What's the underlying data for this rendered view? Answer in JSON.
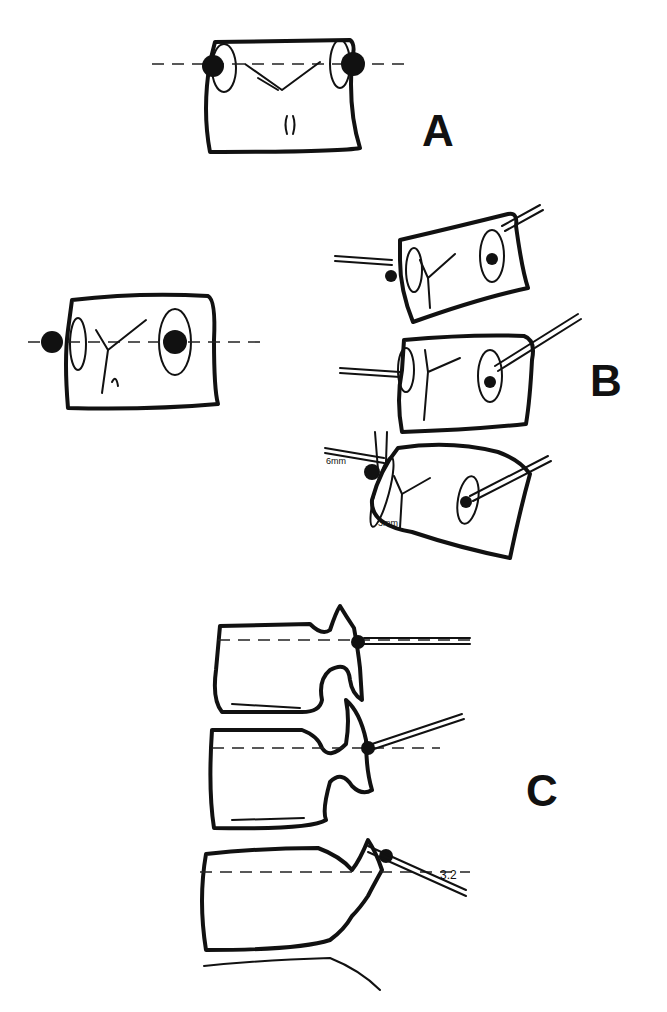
{
  "figure": {
    "panels": [
      {
        "id": "A",
        "label": "A",
        "description": "Single vertebral body, axial view with two pedicle screws on horizontal dashed reference line"
      },
      {
        "id": "B",
        "label": "B",
        "description": "Vertebral body with screws and three tilted vertebrae with guide wires / needles"
      },
      {
        "id": "C",
        "label": "C",
        "description": "Lateral view of three lumbar vertebrae with needles entering at pedicles"
      }
    ],
    "annotations": {
      "b_offset_top": "6mm",
      "b_offset_bottom": "3mm",
      "c_angle": "3.2"
    },
    "colors": {
      "ink": "#111111",
      "background": "#ffffff"
    }
  }
}
